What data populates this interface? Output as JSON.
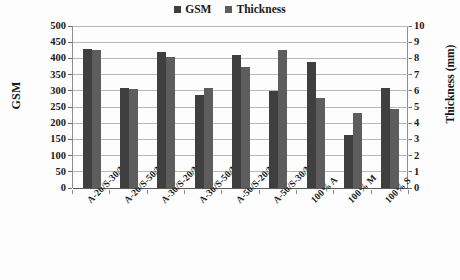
{
  "chart_data": {
    "type": "bar",
    "title": "",
    "subtitle": "",
    "xlabel": "",
    "ylabel": "GSM",
    "y2label": "Thickness (mm)",
    "categories": [
      "A-20/S-30/M-50",
      "A-20/S-50/M-30",
      "A-30/S-20/M-50",
      "A-30/S-50/M-20",
      "A-50/S-20/M-30",
      "A-50/S-30/M-20",
      "100% A",
      "100% M",
      "100% S"
    ],
    "series": [
      {
        "name": "GSM",
        "axis": "left",
        "color": "#3f3f3f",
        "values": [
          430,
          308,
          420,
          288,
          411,
          300,
          390,
          163,
          310
        ]
      },
      {
        "name": "Thickness",
        "axis": "right",
        "color": "#5d5d5d",
        "values": [
          8.55,
          6.1,
          8.1,
          6.2,
          7.45,
          8.55,
          5.55,
          4.65,
          4.9
        ]
      }
    ],
    "ylim": [
      0,
      500
    ],
    "y2lim": [
      0,
      10
    ],
    "yticks": [
      0,
      50,
      100,
      150,
      200,
      250,
      300,
      350,
      400,
      450,
      500
    ],
    "y2ticks": [
      0,
      1,
      2,
      3,
      4,
      5,
      6,
      7,
      8,
      9,
      10
    ],
    "grid": true,
    "legend_position": "top-center"
  },
  "legend": {
    "entries": [
      {
        "label": "GSM",
        "color": "#3f3f3f"
      },
      {
        "label": "Thickness",
        "color": "#5d5d5d"
      }
    ]
  },
  "axes": {
    "left_title": "GSM",
    "right_title": "Thickness (mm)",
    "left_ticks": [
      "500",
      "450",
      "400",
      "350",
      "300",
      "250",
      "200",
      "150",
      "100",
      "50",
      "0"
    ],
    "right_ticks": [
      "10",
      "9",
      "8",
      "7",
      "6",
      "5",
      "4",
      "3",
      "2",
      "1",
      "0"
    ]
  }
}
